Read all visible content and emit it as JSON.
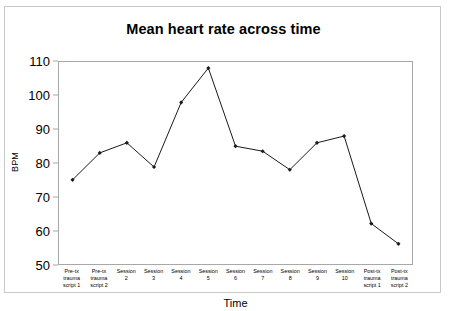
{
  "chart_data": {
    "type": "line",
    "title": "Mean heart rate across time",
    "xlabel": "Time",
    "ylabel": "BPM",
    "ylim": [
      50,
      110
    ],
    "yticks": [
      110,
      100,
      90,
      80,
      70,
      60,
      50
    ],
    "grid": false,
    "legend": null,
    "marker": "filled-diamond",
    "line_color": "#1a1a1a",
    "categories": [
      "Pre-tx\ntrauma\nscript 1",
      "Pre-tx\ntrauma\nscript 2",
      "Session\n2",
      "Session\n3",
      "Session\n4",
      "Session\n5",
      "Session\n6",
      "Session\n7",
      "Session\n8",
      "Session\n9",
      "Session\n10",
      "Post-tx\ntrauma\nscript 1",
      "Post-tx\ntrauma\nscript 2"
    ],
    "values": [
      75,
      83,
      86,
      78.8,
      98,
      108.2,
      85,
      83.5,
      78,
      86,
      88,
      62,
      56
    ]
  },
  "caption": {
    "sliver_text": ""
  }
}
